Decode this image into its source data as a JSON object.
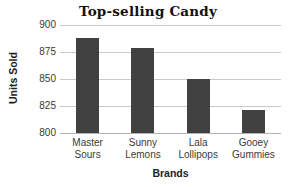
{
  "chart_data": {
    "type": "bar",
    "title": "Top-selling Candy",
    "xlabel": "Brands",
    "ylabel": "Units Sold",
    "categories": [
      "Master Sours",
      "Sunny Lemons",
      "Lala Lollipops",
      "Gooey Gummies"
    ],
    "category_lines": [
      [
        "Master",
        "Sours"
      ],
      [
        "Sunny",
        "Lemons"
      ],
      [
        "Lala",
        "Lollipops"
      ],
      [
        "Gooey",
        "Gummies"
      ]
    ],
    "values": [
      888,
      879,
      850,
      821
    ],
    "ylim": [
      800,
      900
    ],
    "yticks": [
      900,
      875,
      850,
      825,
      800
    ],
    "ytick_labels": [
      "900",
      "875",
      "850",
      "825",
      "800"
    ],
    "grid": "horizontal",
    "legend": "none",
    "bar_color": "#414141",
    "grid_color": "#c9c9c9",
    "axis_color": "#b3b3b3",
    "background_color": "#ffffff"
  }
}
